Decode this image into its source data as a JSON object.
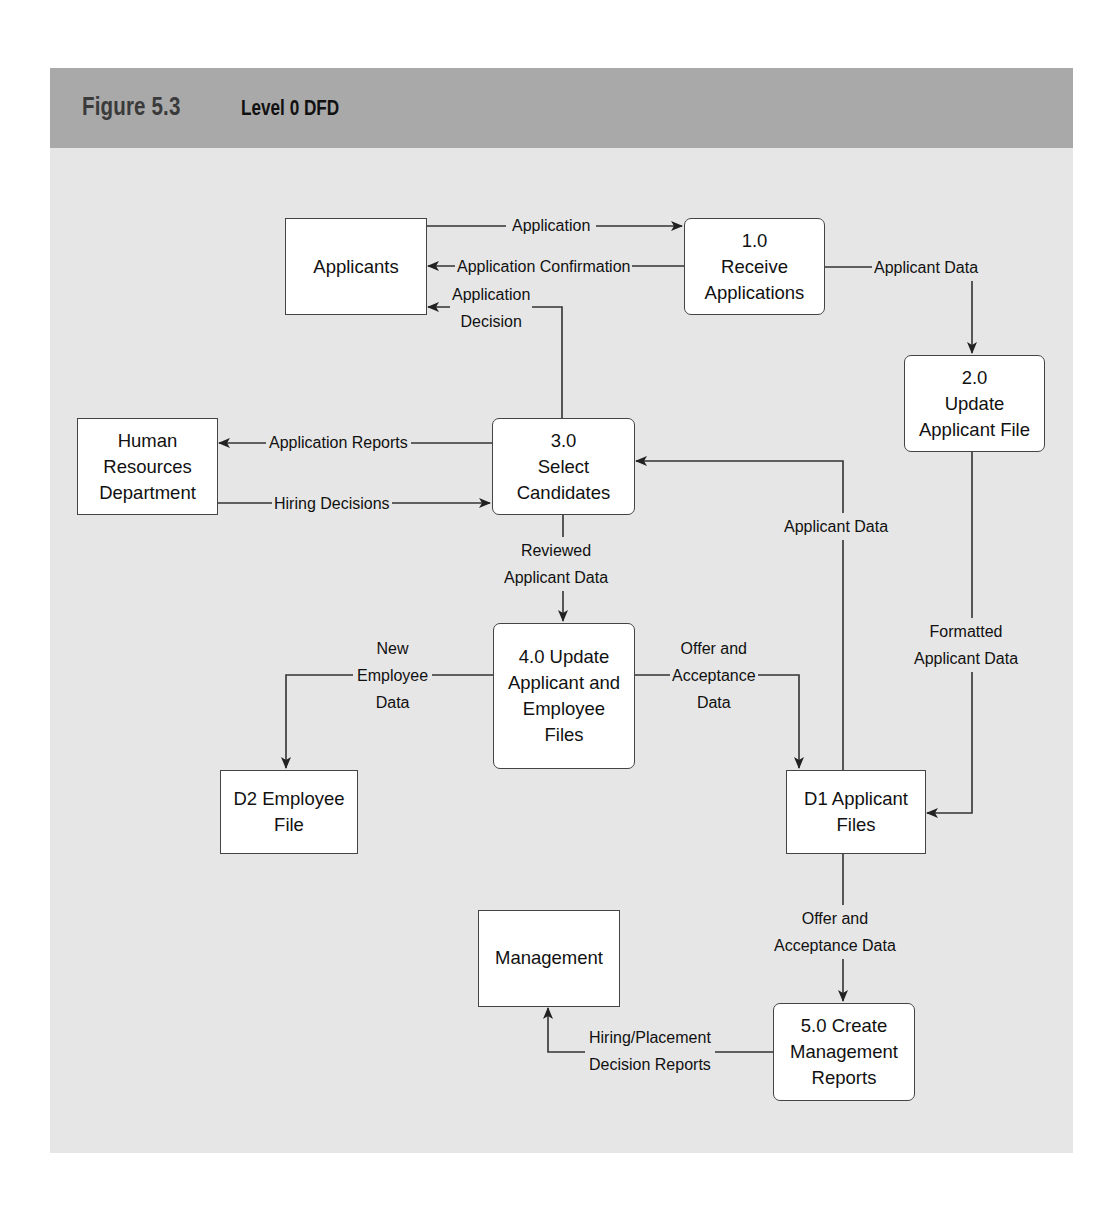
{
  "figure": {
    "number": "Figure 5.3",
    "title": "Level 0 DFD",
    "colors": {
      "header": "#a9a9a9",
      "panel": "#e6e6e6",
      "node_fill": "#ffffff",
      "stroke": "#444444"
    }
  },
  "external_entities": [
    {
      "id": "applicants",
      "lines": [
        "Applicants"
      ]
    },
    {
      "id": "hr",
      "lines": [
        "Human",
        "Resources",
        "Department"
      ]
    },
    {
      "id": "management",
      "lines": [
        "Management"
      ]
    }
  ],
  "processes": [
    {
      "id": "p1",
      "lines": [
        "1.0",
        "Receive",
        "Applications"
      ]
    },
    {
      "id": "p2",
      "lines": [
        "2.0",
        "Update",
        "Applicant File"
      ]
    },
    {
      "id": "p3",
      "lines": [
        "3.0",
        "Select",
        "Candidates"
      ]
    },
    {
      "id": "p4",
      "lines": [
        "4.0 Update",
        "Applicant and",
        "Employee",
        "Files"
      ]
    },
    {
      "id": "p5",
      "lines": [
        "5.0 Create",
        "Management",
        "Reports"
      ]
    }
  ],
  "data_stores": [
    {
      "id": "d2",
      "lines": [
        "D2 Employee",
        "File"
      ]
    },
    {
      "id": "d1",
      "lines": [
        "D1 Applicant",
        "Files"
      ]
    }
  ],
  "flows": [
    {
      "from": "applicants",
      "to": "p1",
      "lines": [
        "Application"
      ]
    },
    {
      "from": "p1",
      "to": "applicants",
      "lines": [
        "Application Confirmation"
      ]
    },
    {
      "from": "p3",
      "to": "applicants",
      "lines": [
        "Application",
        "Decision"
      ]
    },
    {
      "from": "p1",
      "to": "p2",
      "lines": [
        "Applicant Data"
      ]
    },
    {
      "from": "p3",
      "to": "hr",
      "lines": [
        "Application Reports"
      ]
    },
    {
      "from": "hr",
      "to": "p3",
      "lines": [
        "Hiring Decisions"
      ]
    },
    {
      "from": "d1",
      "to": "p3",
      "lines": [
        "Applicant Data"
      ]
    },
    {
      "from": "p2",
      "to": "d1",
      "lines": [
        "Formatted",
        "Applicant Data"
      ]
    },
    {
      "from": "p3",
      "to": "p4",
      "lines": [
        "Reviewed",
        "Applicant Data"
      ]
    },
    {
      "from": "p4",
      "to": "d2",
      "lines": [
        "New",
        "Employee",
        "Data"
      ]
    },
    {
      "from": "p4",
      "to": "d1",
      "lines": [
        "Offer and",
        "Acceptance",
        "Data"
      ]
    },
    {
      "from": "d1",
      "to": "p5",
      "lines": [
        "Offer and",
        "Acceptance Data"
      ]
    },
    {
      "from": "p5",
      "to": "management",
      "lines": [
        "Hiring/Placement",
        "Decision Reports"
      ]
    }
  ]
}
